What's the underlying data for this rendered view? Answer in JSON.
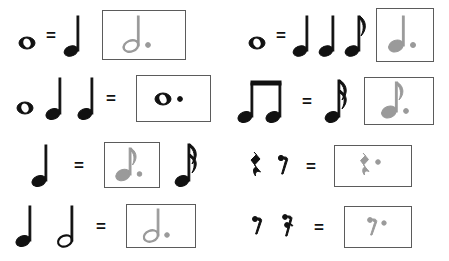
{
  "worksheet": {
    "title": "Note and Rest Value Equations Worksheet",
    "equals_sign": "=",
    "answer_color": "#9a9a9a",
    "ink_color": "#111111",
    "box_border_color": "#5b5b5b",
    "background_color": "#ffffff",
    "columns": 2,
    "rows": 4
  },
  "problems": [
    {
      "id": "r1c1",
      "position": "row1-left",
      "left_terms": [
        {
          "symbol": "whole-note",
          "label": "whole note"
        }
      ],
      "operator": "=",
      "right_terms": [
        {
          "symbol": "quarter-note",
          "label": "quarter note",
          "boxed": false
        }
      ],
      "answer": {
        "symbol": "dotted-half-note",
        "label": "dotted half note",
        "boxed": true,
        "handwritten": true,
        "box_width": 84,
        "box_height": 50
      },
      "trailing_terms": []
    },
    {
      "id": "r1c2",
      "position": "row1-right",
      "left_terms": [
        {
          "symbol": "whole-note",
          "label": "whole note"
        }
      ],
      "operator": "=",
      "right_terms": [
        {
          "symbol": "quarter-note",
          "label": "quarter note",
          "boxed": false
        },
        {
          "symbol": "quarter-note",
          "label": "quarter note",
          "boxed": false
        },
        {
          "symbol": "eighth-note",
          "label": "eighth note",
          "boxed": false
        }
      ],
      "answer": {
        "symbol": "dotted-quarter-note",
        "label": "dotted quarter note",
        "boxed": true,
        "handwritten": true,
        "box_width": 58,
        "box_height": 54
      },
      "trailing_terms": []
    },
    {
      "id": "r2c1",
      "position": "row2-left",
      "left_terms": [
        {
          "symbol": "whole-note",
          "label": "whole note"
        },
        {
          "symbol": "quarter-note",
          "label": "quarter note"
        },
        {
          "symbol": "quarter-note",
          "label": "quarter note"
        }
      ],
      "operator": "=",
      "right_terms": [],
      "answer": {
        "symbol": "dotted-whole-note",
        "label": "dotted whole note",
        "boxed": true,
        "handwritten": false,
        "box_width": 75,
        "box_height": 47
      },
      "trailing_terms": []
    },
    {
      "id": "r2c2",
      "position": "row2-right",
      "left_terms": [
        {
          "symbol": "beamed-eighth-pair",
          "label": "two beamed eighth notes"
        }
      ],
      "operator": "=",
      "right_terms": [
        {
          "symbol": "sixteenth-note",
          "label": "sixteenth note",
          "boxed": false
        }
      ],
      "answer": {
        "symbol": "dotted-eighth-note",
        "label": "dotted eighth note",
        "boxed": true,
        "handwritten": true,
        "box_width": 70,
        "box_height": 48
      },
      "trailing_terms": []
    },
    {
      "id": "r3c1",
      "position": "row3-left",
      "left_terms": [
        {
          "symbol": "quarter-note",
          "label": "quarter note"
        }
      ],
      "operator": "=",
      "right_terms": [],
      "answer": {
        "symbol": "dotted-eighth-note",
        "label": "dotted eighth note",
        "boxed": true,
        "handwritten": true,
        "box_width": 56,
        "box_height": 46
      },
      "trailing_terms": [
        {
          "symbol": "sixteenth-note",
          "label": "sixteenth note"
        }
      ]
    },
    {
      "id": "r3c2",
      "position": "row3-right",
      "left_terms": [
        {
          "symbol": "quarter-rest",
          "label": "quarter rest"
        },
        {
          "symbol": "eighth-rest",
          "label": "eighth rest"
        }
      ],
      "operator": "=",
      "right_terms": [],
      "answer": {
        "symbol": "dotted-quarter-rest",
        "label": "dotted quarter rest",
        "boxed": true,
        "handwritten": true,
        "box_width": 78,
        "box_height": 42
      },
      "trailing_terms": []
    },
    {
      "id": "r4c1",
      "position": "row4-left",
      "left_terms": [
        {
          "symbol": "quarter-note",
          "label": "quarter note"
        },
        {
          "symbol": "half-note",
          "label": "half note"
        }
      ],
      "operator": "=",
      "right_terms": [],
      "answer": {
        "symbol": "dotted-half-note",
        "label": "dotted half note",
        "boxed": true,
        "handwritten": false,
        "box_width": 70,
        "box_height": 44
      },
      "trailing_terms": []
    },
    {
      "id": "r4c2",
      "position": "row4-right",
      "left_terms": [
        {
          "symbol": "eighth-rest",
          "label": "eighth rest"
        },
        {
          "symbol": "sixteenth-rest",
          "label": "sixteenth rest"
        }
      ],
      "operator": "=",
      "right_terms": [],
      "answer": {
        "symbol": "dotted-eighth-rest",
        "label": "dotted eighth rest",
        "boxed": true,
        "handwritten": true,
        "box_width": 68,
        "box_height": 42
      },
      "trailing_terms": []
    }
  ]
}
